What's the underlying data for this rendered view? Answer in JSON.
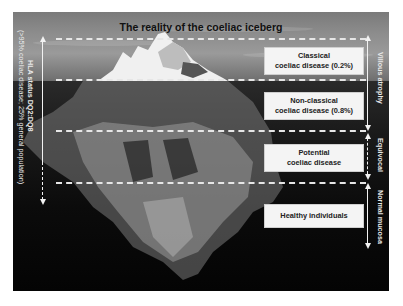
{
  "title": "The reality of the coeliac iceberg",
  "tiers": [
    {
      "label_line1": "Classical",
      "label_line2": "coeliac disease (0.2%)"
    },
    {
      "label_line1": "Non-classical",
      "label_line2": "coeliac disease (0.8%)"
    },
    {
      "label_line1": "Potential",
      "label_line2": "coeliac disease"
    },
    {
      "label_line1": "Healthy individuals",
      "label_line2": ""
    }
  ],
  "left_axis": {
    "line1": "HLA status DQ2:DQ8",
    "line2": "(>95% coeliac disease; 25% general population)"
  },
  "right_axis": {
    "villous": "Villous atrophy",
    "equivocal": "Equivocal",
    "normal": "Normal mucosa"
  },
  "colors": {
    "label_bg": "#f4f4f4",
    "dash": "#e6e6e6",
    "water": "#0b0b0b",
    "sky": "#8c8c8c"
  }
}
